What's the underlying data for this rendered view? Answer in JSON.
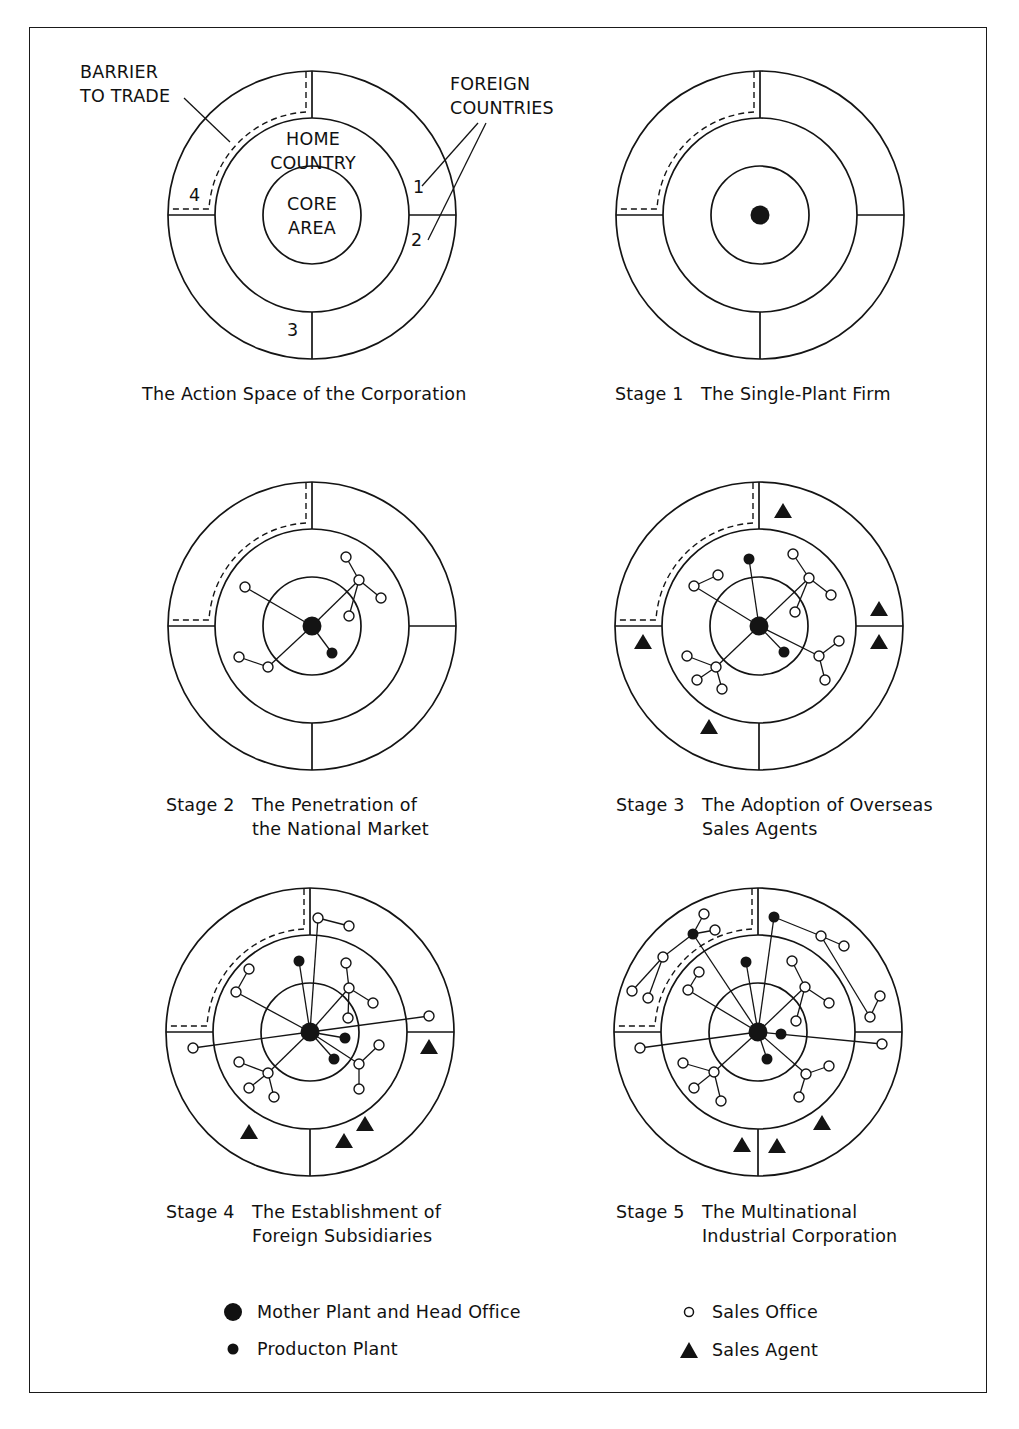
{
  "figure": {
    "labels": {
      "barrier": "BARRIER\nTO TRADE",
      "foreign": "FOREIGN\nCOUNTRIES",
      "home": "HOME\nCOUNTRY",
      "core": "CORE\nAREA",
      "regions": [
        "1",
        "2",
        "3",
        "4"
      ]
    },
    "panels": [
      {
        "id": "action-space",
        "stage": "",
        "title": "The Action Space of the Corporation",
        "title2": ""
      },
      {
        "id": "stage-1",
        "stage": "Stage 1",
        "title": "The Single-Plant Firm",
        "title2": ""
      },
      {
        "id": "stage-2",
        "stage": "Stage 2",
        "title": "The Penetration of",
        "title2": "the National Market"
      },
      {
        "id": "stage-3",
        "stage": "Stage 3",
        "title": "The Adoption of Overseas",
        "title2": "Sales Agents"
      },
      {
        "id": "stage-4",
        "stage": "Stage 4",
        "title": "The Establishment of",
        "title2": "Foreign Subsidiaries"
      },
      {
        "id": "stage-5",
        "stage": "Stage 5",
        "title": "The Multinational",
        "title2": "Industrial Corporation"
      }
    ],
    "legend": [
      {
        "symbol": "large-filled-circle",
        "label": "Mother Plant and Head Office"
      },
      {
        "symbol": "small-filled-circle",
        "label": "Producton Plant"
      },
      {
        "symbol": "open-circle",
        "label": "Sales Office"
      },
      {
        "symbol": "filled-triangle",
        "label": "Sales Agent"
      }
    ]
  },
  "diagram_data": {
    "rings": {
      "outer_r": 144,
      "middle_r": 97,
      "inner_r": 49
    },
    "centers": [
      [
        312,
        215
      ],
      [
        760,
        215
      ],
      [
        312,
        626
      ],
      [
        759,
        626
      ],
      [
        310,
        1032
      ],
      [
        758,
        1032
      ]
    ],
    "stages": [
      {
        "hq": false,
        "plants": [],
        "offices": [],
        "agents": [],
        "links": []
      },
      {
        "hq": true,
        "plants": [],
        "offices": [],
        "agents": [],
        "links": []
      },
      {
        "hq": true,
        "plants": [
          [
            20,
            27
          ]
        ],
        "offices": [
          [
            -67,
            -39
          ],
          [
            -73,
            31
          ],
          [
            -44,
            41
          ],
          [
            34,
            -69
          ],
          [
            47,
            -46
          ],
          [
            69,
            -28
          ],
          [
            37,
            -10
          ]
        ],
        "agents": [],
        "links": [
          [
            [
              0,
              0
            ],
            [
              -67,
              -39
            ]
          ],
          [
            [
              0,
              0
            ],
            [
              -44,
              41
            ]
          ],
          [
            [
              -44,
              41
            ],
            [
              -73,
              31
            ]
          ],
          [
            [
              0,
              0
            ],
            [
              20,
              27
            ]
          ],
          [
            [
              0,
              0
            ],
            [
              47,
              -46
            ]
          ],
          [
            [
              47,
              -46
            ],
            [
              34,
              -69
            ]
          ],
          [
            [
              47,
              -46
            ],
            [
              69,
              -28
            ]
          ],
          [
            [
              47,
              -46
            ],
            [
              37,
              -10
            ]
          ]
        ]
      },
      {
        "hq": true,
        "plants": [
          [
            -10,
            -67
          ],
          [
            25,
            26
          ]
        ],
        "offices": [
          [
            -65,
            -40
          ],
          [
            -41,
            -51
          ],
          [
            34,
            -72
          ],
          [
            50,
            -48
          ],
          [
            72,
            -31
          ],
          [
            36,
            -14
          ],
          [
            60,
            30
          ],
          [
            80,
            15
          ],
          [
            66,
            54
          ],
          [
            -43,
            41
          ],
          [
            -72,
            30
          ],
          [
            -62,
            54
          ],
          [
            -37,
            63
          ]
        ],
        "agents": [
          [
            24,
            -115
          ],
          [
            120,
            -17
          ],
          [
            120,
            16
          ],
          [
            -116,
            16
          ],
          [
            -50,
            101
          ]
        ],
        "links": [
          [
            [
              0,
              0
            ],
            [
              -10,
              -67
            ]
          ],
          [
            [
              0,
              0
            ],
            [
              -65,
              -40
            ]
          ],
          [
            [
              -65,
              -40
            ],
            [
              -41,
              -51
            ]
          ],
          [
            [
              0,
              0
            ],
            [
              50,
              -48
            ]
          ],
          [
            [
              50,
              -48
            ],
            [
              34,
              -72
            ]
          ],
          [
            [
              50,
              -48
            ],
            [
              72,
              -31
            ]
          ],
          [
            [
              50,
              -48
            ],
            [
              36,
              -14
            ]
          ],
          [
            [
              0,
              0
            ],
            [
              25,
              26
            ]
          ],
          [
            [
              0,
              0
            ],
            [
              60,
              30
            ]
          ],
          [
            [
              60,
              30
            ],
            [
              80,
              15
            ]
          ],
          [
            [
              60,
              30
            ],
            [
              66,
              54
            ]
          ],
          [
            [
              0,
              0
            ],
            [
              -43,
              41
            ]
          ],
          [
            [
              -43,
              41
            ],
            [
              -72,
              30
            ]
          ],
          [
            [
              -43,
              41
            ],
            [
              -62,
              54
            ]
          ],
          [
            [
              -43,
              41
            ],
            [
              -37,
              63
            ]
          ]
        ]
      },
      {
        "hq": true,
        "plants": [
          [
            -11,
            -71
          ],
          [
            35,
            6
          ],
          [
            24,
            27
          ]
        ],
        "offices": [
          [
            8,
            -114
          ],
          [
            39,
            -106
          ],
          [
            -61,
            -63
          ],
          [
            -74,
            -40
          ],
          [
            36,
            -69
          ],
          [
            39,
            -44
          ],
          [
            63,
            -29
          ],
          [
            38,
            -14
          ],
          [
            119,
            -16
          ],
          [
            -117,
            16
          ],
          [
            49,
            32
          ],
          [
            69,
            13
          ],
          [
            49,
            57
          ],
          [
            -42,
            41
          ],
          [
            -71,
            30
          ],
          [
            -61,
            56
          ],
          [
            -36,
            65
          ]
        ],
        "agents": [
          [
            119,
            15
          ],
          [
            -61,
            100
          ],
          [
            34,
            109
          ],
          [
            55,
            92
          ]
        ],
        "links": [
          [
            [
              0,
              0
            ],
            [
              -11,
              -71
            ]
          ],
          [
            [
              0,
              0
            ],
            [
              8,
              -114
            ]
          ],
          [
            [
              8,
              -114
            ],
            [
              39,
              -106
            ]
          ],
          [
            [
              0,
              0
            ],
            [
              -74,
              -40
            ]
          ],
          [
            [
              -74,
              -40
            ],
            [
              -61,
              -63
            ]
          ],
          [
            [
              0,
              0
            ],
            [
              39,
              -44
            ]
          ],
          [
            [
              39,
              -44
            ],
            [
              36,
              -69
            ]
          ],
          [
            [
              39,
              -44
            ],
            [
              63,
              -29
            ]
          ],
          [
            [
              39,
              -44
            ],
            [
              38,
              -14
            ]
          ],
          [
            [
              0,
              0
            ],
            [
              119,
              -16
            ]
          ],
          [
            [
              0,
              0
            ],
            [
              -117,
              16
            ]
          ],
          [
            [
              0,
              0
            ],
            [
              35,
              6
            ]
          ],
          [
            [
              0,
              0
            ],
            [
              24,
              27
            ]
          ],
          [
            [
              0,
              0
            ],
            [
              49,
              32
            ]
          ],
          [
            [
              49,
              32
            ],
            [
              69,
              13
            ]
          ],
          [
            [
              49,
              32
            ],
            [
              49,
              57
            ]
          ],
          [
            [
              0,
              0
            ],
            [
              -42,
              41
            ]
          ],
          [
            [
              -42,
              41
            ],
            [
              -71,
              30
            ]
          ],
          [
            [
              -42,
              41
            ],
            [
              -61,
              56
            ]
          ],
          [
            [
              -42,
              41
            ],
            [
              -36,
              65
            ]
          ]
        ]
      },
      {
        "hq": true,
        "plants": [
          [
            16,
            -115
          ],
          [
            -65,
            -98
          ],
          [
            -12,
            -70
          ],
          [
            23,
            2
          ],
          [
            9,
            27
          ]
        ],
        "offices": [
          [
            63,
            -96
          ],
          [
            86,
            -86
          ],
          [
            112,
            -15
          ],
          [
            122,
            -36
          ],
          [
            -54,
            -118
          ],
          [
            -43,
            -102
          ],
          [
            -95,
            -75
          ],
          [
            -126,
            -41
          ],
          [
            -110,
            -34
          ],
          [
            -59,
            -60
          ],
          [
            -70,
            -42
          ],
          [
            34,
            -71
          ],
          [
            47,
            -45
          ],
          [
            71,
            -29
          ],
          [
            38,
            -11
          ],
          [
            124,
            12
          ],
          [
            -118,
            16
          ],
          [
            48,
            42
          ],
          [
            71,
            34
          ],
          [
            41,
            65
          ],
          [
            -44,
            40
          ],
          [
            -75,
            31
          ],
          [
            -64,
            56
          ],
          [
            -37,
            69
          ]
        ],
        "agents": [
          [
            -16,
            113
          ],
          [
            19,
            114
          ],
          [
            64,
            91
          ]
        ],
        "links": [
          [
            [
              0,
              0
            ],
            [
              16,
              -115
            ]
          ],
          [
            [
              16,
              -115
            ],
            [
              63,
              -96
            ]
          ],
          [
            [
              63,
              -96
            ],
            [
              86,
              -86
            ]
          ],
          [
            [
              63,
              -96
            ],
            [
              112,
              -15
            ]
          ],
          [
            [
              112,
              -15
            ],
            [
              122,
              -36
            ]
          ],
          [
            [
              0,
              0
            ],
            [
              -65,
              -98
            ]
          ],
          [
            [
              -65,
              -98
            ],
            [
              -54,
              -118
            ]
          ],
          [
            [
              -65,
              -98
            ],
            [
              -43,
              -102
            ]
          ],
          [
            [
              -65,
              -98
            ],
            [
              -95,
              -75
            ]
          ],
          [
            [
              -95,
              -75
            ],
            [
              -126,
              -41
            ]
          ],
          [
            [
              -95,
              -75
            ],
            [
              -110,
              -34
            ]
          ],
          [
            [
              0,
              0
            ],
            [
              -12,
              -70
            ]
          ],
          [
            [
              0,
              0
            ],
            [
              -70,
              -42
            ]
          ],
          [
            [
              -70,
              -42
            ],
            [
              -59,
              -60
            ]
          ],
          [
            [
              0,
              0
            ],
            [
              47,
              -45
            ]
          ],
          [
            [
              47,
              -45
            ],
            [
              34,
              -71
            ]
          ],
          [
            [
              47,
              -45
            ],
            [
              71,
              -29
            ]
          ],
          [
            [
              47,
              -45
            ],
            [
              38,
              -11
            ]
          ],
          [
            [
              0,
              0
            ],
            [
              124,
              12
            ]
          ],
          [
            [
              0,
              0
            ],
            [
              -118,
              16
            ]
          ],
          [
            [
              0,
              0
            ],
            [
              9,
              27
            ]
          ],
          [
            [
              0,
              0
            ],
            [
              48,
              42
            ]
          ],
          [
            [
              48,
              42
            ],
            [
              71,
              34
            ]
          ],
          [
            [
              48,
              42
            ],
            [
              41,
              65
            ]
          ],
          [
            [
              0,
              0
            ],
            [
              -44,
              40
            ]
          ],
          [
            [
              -44,
              40
            ],
            [
              -75,
              31
            ]
          ],
          [
            [
              -44,
              40
            ],
            [
              -64,
              56
            ]
          ],
          [
            [
              -44,
              40
            ],
            [
              -37,
              69
            ]
          ]
        ]
      }
    ]
  }
}
